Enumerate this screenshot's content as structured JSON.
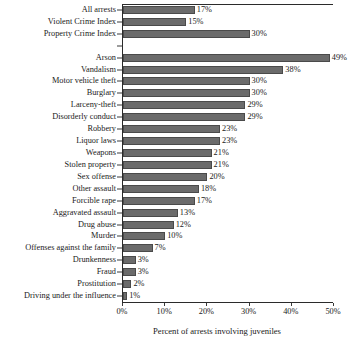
{
  "chart_data": {
    "type": "bar",
    "orientation": "horizontal",
    "title": "",
    "xlabel": "Percent of arrests involving juveniles",
    "ylabel": "",
    "xlim": [
      0,
      50
    ],
    "xticks": [
      "0%",
      "10%",
      "20%",
      "30%",
      "40%",
      "50%"
    ],
    "xtick_values": [
      0,
      10,
      20,
      30,
      40,
      50
    ],
    "grid": false,
    "legend": null,
    "value_suffix": "%",
    "bar_color": "#6b6b6b",
    "bar_edge_color": "#4a4a4a",
    "axis_color": "#2b2b2b",
    "categories": [
      "All arrests",
      "Violent Crime Index",
      "Property Crime Index",
      "",
      "Arson",
      "Vandalism",
      "Motor vehicle theft",
      "Burglary",
      "Larceny-theft",
      "Disorderly conduct",
      "Robbery",
      "Liquor laws",
      "Weapons",
      "Stolen property",
      "Sex offense",
      "Other assault",
      "Forcible rape",
      "Aggravated assault",
      "Drug abuse",
      "Murder",
      "Offenses against the family",
      "Drunkenness",
      "Fraud",
      "Prostitution",
      "Driving under the influence"
    ],
    "values": [
      17,
      15,
      30,
      null,
      49,
      38,
      30,
      30,
      29,
      29,
      23,
      23,
      21,
      21,
      20,
      18,
      17,
      13,
      12,
      10,
      7,
      3,
      3,
      2,
      1
    ],
    "value_labels": [
      "17%",
      "15%",
      "30%",
      "",
      "49%",
      "38%",
      "30%",
      "30%",
      "29%",
      "29%",
      "23%",
      "23%",
      "21%",
      "21%",
      "20%",
      "18%",
      "17%",
      "13%",
      "12%",
      "10%",
      "7%",
      "3%",
      "3%",
      "2%",
      "1%"
    ],
    "rows": [
      {
        "label": "All arrests",
        "value": 17,
        "value_label": "17%",
        "spacer": false
      },
      {
        "label": "Violent Crime Index",
        "value": 15,
        "value_label": "15%",
        "spacer": false
      },
      {
        "label": "Property Crime Index",
        "value": 30,
        "value_label": "30%",
        "spacer": false
      },
      {
        "label": "",
        "value": 0,
        "value_label": "",
        "spacer": true
      },
      {
        "label": "Arson",
        "value": 49,
        "value_label": "49%",
        "spacer": false
      },
      {
        "label": "Vandalism",
        "value": 38,
        "value_label": "38%",
        "spacer": false
      },
      {
        "label": "Motor vehicle theft",
        "value": 30,
        "value_label": "30%",
        "spacer": false
      },
      {
        "label": "Burglary",
        "value": 30,
        "value_label": "30%",
        "spacer": false
      },
      {
        "label": "Larceny-theft",
        "value": 29,
        "value_label": "29%",
        "spacer": false
      },
      {
        "label": "Disorderly conduct",
        "value": 29,
        "value_label": "29%",
        "spacer": false
      },
      {
        "label": "Robbery",
        "value": 23,
        "value_label": "23%",
        "spacer": false
      },
      {
        "label": "Liquor laws",
        "value": 23,
        "value_label": "23%",
        "spacer": false
      },
      {
        "label": "Weapons",
        "value": 21,
        "value_label": "21%",
        "spacer": false
      },
      {
        "label": "Stolen property",
        "value": 21,
        "value_label": "21%",
        "spacer": false
      },
      {
        "label": "Sex offense",
        "value": 20,
        "value_label": "20%",
        "spacer": false
      },
      {
        "label": "Other assault",
        "value": 18,
        "value_label": "18%",
        "spacer": false
      },
      {
        "label": "Forcible rape",
        "value": 17,
        "value_label": "17%",
        "spacer": false
      },
      {
        "label": "Aggravated assault",
        "value": 13,
        "value_label": "13%",
        "spacer": false
      },
      {
        "label": "Drug abuse",
        "value": 12,
        "value_label": "12%",
        "spacer": false
      },
      {
        "label": "Murder",
        "value": 10,
        "value_label": "10%",
        "spacer": false
      },
      {
        "label": "Offenses against the family",
        "value": 7,
        "value_label": "7%",
        "spacer": false
      },
      {
        "label": "Drunkenness",
        "value": 3,
        "value_label": "3%",
        "spacer": false
      },
      {
        "label": "Fraud",
        "value": 3,
        "value_label": "3%",
        "spacer": false
      },
      {
        "label": "Prostitution",
        "value": 2,
        "value_label": "2%",
        "spacer": false
      },
      {
        "label": "Driving under the influence",
        "value": 1,
        "value_label": "1%",
        "spacer": false
      }
    ]
  }
}
